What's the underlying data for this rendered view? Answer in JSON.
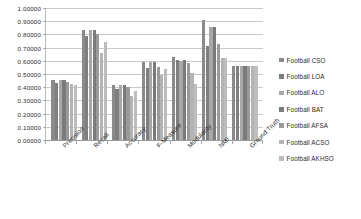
{
  "chart_data": {
    "type": "bar",
    "title": "",
    "subtitle": "",
    "xlabel": "",
    "ylabel": "",
    "ylim": [
      0,
      1
    ],
    "ytick_step": 0.1,
    "ytick_labels": [
      "1.00000",
      "0.90000",
      "0.80000",
      "0.70000",
      "0.60000",
      "0.50000",
      "0.40000",
      "0.30000",
      "0.20000",
      "0.10000",
      "0.00000"
    ],
    "ytick_values": [
      1.0,
      0.9,
      0.8,
      0.7,
      0.6,
      0.5,
      0.4,
      0.3,
      0.2,
      0.1,
      0.0
    ],
    "grid": true,
    "grid_axis": "y",
    "legend_position": "right",
    "categories": [
      "Precision",
      "Recall",
      "Accuracy",
      "F-Measure",
      "Modularity",
      "NMI",
      "Ground Truth"
    ],
    "series": [
      {
        "name": "Football CSO",
        "color": "#8a8a8a",
        "values": [
          0.453,
          0.832,
          0.415,
          0.588,
          0.63,
          0.912,
          0.562
        ]
      },
      {
        "name": "Football LOA",
        "color": "#7f7f7f",
        "values": [
          0.435,
          0.79,
          0.385,
          0.545,
          0.605,
          0.71,
          0.562
        ]
      },
      {
        "name": "Football ALO",
        "color": "#a8a8a8",
        "values": [
          0.453,
          0.832,
          0.415,
          0.588,
          0.6,
          0.855,
          0.562
        ]
      },
      {
        "name": "Football BAT",
        "color": "#7a7a7a",
        "values": [
          0.453,
          0.832,
          0.415,
          0.588,
          0.605,
          0.855,
          0.562
        ]
      },
      {
        "name": "Football AFSA",
        "color": "#9a9a9a",
        "values": [
          0.44,
          0.8,
          0.4,
          0.555,
          0.58,
          0.73,
          0.562
        ]
      },
      {
        "name": "Football ACSO",
        "color": "#b4b4b4",
        "values": [
          0.425,
          0.66,
          0.335,
          0.49,
          0.51,
          0.62,
          0.562
        ]
      },
      {
        "name": "Football AKHSO",
        "color": "#bdbdbd",
        "values": [
          0.42,
          0.745,
          0.375,
          0.54,
          0.425,
          0.62,
          0.562
        ]
      }
    ]
  },
  "legend": {
    "items": [
      {
        "label": "Football CSO"
      },
      {
        "label": "Football LOA"
      },
      {
        "label": "Football ALO"
      },
      {
        "label": "Football BAT"
      },
      {
        "label": "Football AFSA"
      },
      {
        "label": "Football ACSO"
      },
      {
        "label": "Football AKHSO"
      }
    ]
  },
  "colors": {
    "background": "#ffffff",
    "gridline": "#c9c9c9",
    "axis": "#9a9a9a",
    "text": "#2a2a2a"
  }
}
